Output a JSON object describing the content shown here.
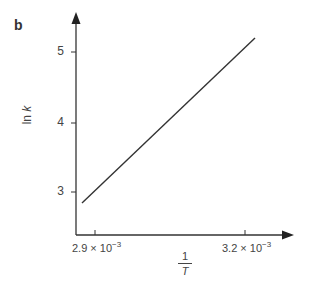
{
  "panel_label": "b",
  "chart_data": {
    "type": "line",
    "title": "",
    "panel": "b",
    "xlabel": "1/T",
    "xlabel_numerator": "1",
    "xlabel_denominator": "T",
    "ylabel": "ln k",
    "x_ticks": [
      {
        "value": 0.0029,
        "label_mantissa": "2.9 × 10",
        "label_exp": "−3"
      },
      {
        "value": 0.0032,
        "label_mantissa": "3.2 × 10",
        "label_exp": "−3"
      }
    ],
    "y_ticks": [
      {
        "value": 3,
        "label": "3"
      },
      {
        "value": 4,
        "label": "4"
      },
      {
        "value": 5,
        "label": "5"
      }
    ],
    "series": [
      {
        "name": "ln k vs 1/T",
        "x": [
          0.002874,
          0.00322
        ],
        "y": [
          2.84,
          5.2
        ]
      }
    ],
    "grid": false,
    "legend": "none",
    "colors": {
      "axis": "#333333",
      "line": "#333333"
    }
  }
}
